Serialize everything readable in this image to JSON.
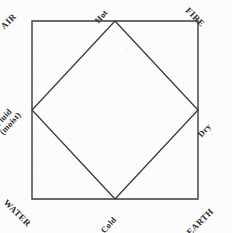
{
  "figure": {
    "type": "diagram",
    "background_color": "#fcfcfc",
    "stroke_color": "#3a3a3a",
    "text_color": "#2b2b2b"
  },
  "corners": {
    "air": "AIR",
    "fire": "FIRE",
    "water": "WATER",
    "earth": "EARTH"
  },
  "qualities": {
    "hot": "Hot",
    "cold": "Cold",
    "dry": "Dry",
    "fluid_line1": "Fluid",
    "fluid_line2": "(moist)"
  },
  "geometry": {
    "square": {
      "top_left_x": 32,
      "top_left_y": 21,
      "bottom_right_x": 198,
      "bottom_right_y": 199,
      "points": "32,21 198,21 198,199 32,199"
    },
    "diamond": {
      "points": "115,21 198,110 115,199 32,110",
      "top_vertex": "115,21",
      "right_vertex": "198,110",
      "bottom_vertex": "115,199",
      "left_vertex": "32,110"
    },
    "stroke_width": 1.4
  }
}
